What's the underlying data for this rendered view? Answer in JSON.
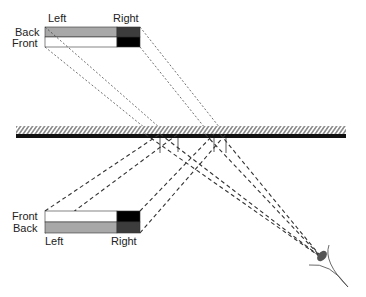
{
  "diagram": {
    "top_box": {
      "label_left": "Left",
      "label_right": "Right",
      "row_back": "Back",
      "row_front": "Front"
    },
    "bottom_box": {
      "label_left": "Left",
      "label_right": "Right",
      "row_front": "Front",
      "row_back": "Back"
    },
    "colors": {
      "back_left": "#a8a8a8",
      "back_right": "#3c3c3c",
      "front_left": "#ffffff",
      "front_right": "#000000",
      "mirror": "#111111",
      "hatch": "#999999"
    }
  }
}
